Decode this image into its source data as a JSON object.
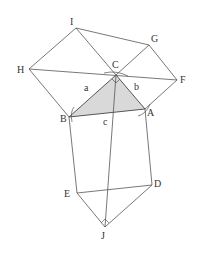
{
  "diagram": {
    "points": {
      "I": [
        76,
        28
      ],
      "G": [
        149,
        45
      ],
      "H": [
        29,
        69
      ],
      "C": [
        116,
        75
      ],
      "F": [
        177,
        80
      ],
      "B": [
        69,
        117
      ],
      "A": [
        145,
        109
      ],
      "E": [
        77,
        193
      ],
      "D": [
        152,
        185
      ],
      "J": [
        105,
        227
      ]
    },
    "labels": {
      "I": "I",
      "G": "G",
      "H": "H",
      "C": "C",
      "F": "F",
      "B": "B",
      "A": "A",
      "E": "E",
      "D": "D",
      "J": "J",
      "side_a": "a",
      "side_b": "b",
      "side_c": "c"
    },
    "shaded_triangle": [
      "A",
      "B",
      "C"
    ],
    "fill_color": "#d9d9d9"
  }
}
